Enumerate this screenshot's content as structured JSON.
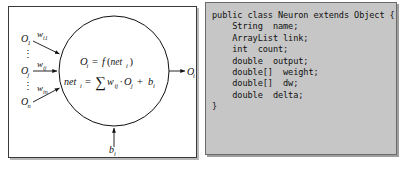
{
  "figure": {
    "background_color": "#ffffff"
  },
  "diagram": {
    "panel_border_color": "#3a3a3a",
    "panel_background": "#ffffff",
    "stroke_color": "#111111",
    "inputs": [
      {
        "label_base": "O",
        "label_sub": "1",
        "weight_base": "w",
        "weight_sub": "i1"
      },
      {
        "label_base": "O",
        "label_sub": "j",
        "weight_base": "w",
        "weight_sub": "ij"
      },
      {
        "label_base": "O",
        "label_sub": "n",
        "weight_base": "w",
        "weight_sub": "in"
      }
    ],
    "vertical_ellipsis": "⋮",
    "neuron": {
      "formula_output": {
        "lhs_base": "O",
        "lhs_sub": "i",
        "eq": "=",
        "fn": "f",
        "open": "(",
        "arg_base": "net",
        "arg_sub": "i",
        "close": ")"
      },
      "formula_net": {
        "lhs_base": "net",
        "lhs_sub": "i",
        "eq": "=",
        "sigma": "∑",
        "w_base": "w",
        "w_sub": "ij",
        "dot": "·",
        "o_base": "O",
        "o_sub": "j",
        "plus": "+",
        "b_base": "b",
        "b_sub": "i"
      }
    },
    "bias": {
      "base": "b",
      "sub": "i"
    },
    "output": {
      "base": "O",
      "sub": "i"
    }
  },
  "code": {
    "language": "java",
    "background_color": "#c6c6c6",
    "text_color": "#111111",
    "lines": [
      "public class Neuron extends Object {",
      "    String  name;",
      "    ArrayList link;",
      "    int  count;",
      "    double  output;",
      "    double[]  weight;",
      "    double[]  dw;",
      "    double  delta;",
      "}"
    ]
  }
}
